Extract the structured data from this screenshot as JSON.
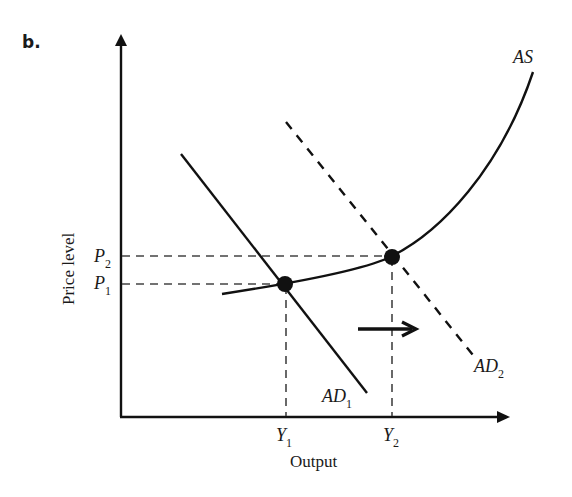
{
  "panel_label": "b.",
  "axes": {
    "y_label": "Price level",
    "x_label": "Output",
    "y_ticks": [
      {
        "base": "P",
        "sub": "2"
      },
      {
        "base": "P",
        "sub": "1"
      }
    ],
    "x_ticks": [
      {
        "base": "Y",
        "sub": "1"
      },
      {
        "base": "Y",
        "sub": "2"
      }
    ]
  },
  "curves": {
    "as": {
      "label": "AS",
      "style": "solid"
    },
    "ad1": {
      "base": "AD",
      "sub": "1",
      "style": "solid"
    },
    "ad2": {
      "base": "AD",
      "sub": "2",
      "style": "dashed"
    }
  },
  "equilibria": [
    {
      "name": "E1",
      "price": "P1",
      "output": "Y1"
    },
    {
      "name": "E2",
      "price": "P2",
      "output": "Y2"
    }
  ],
  "shift_arrow": {
    "direction": "right",
    "meaning": "AD1 shifts to AD2"
  },
  "colors": {
    "ink": "#111111",
    "guide": "#444444",
    "background": "#ffffff"
  }
}
